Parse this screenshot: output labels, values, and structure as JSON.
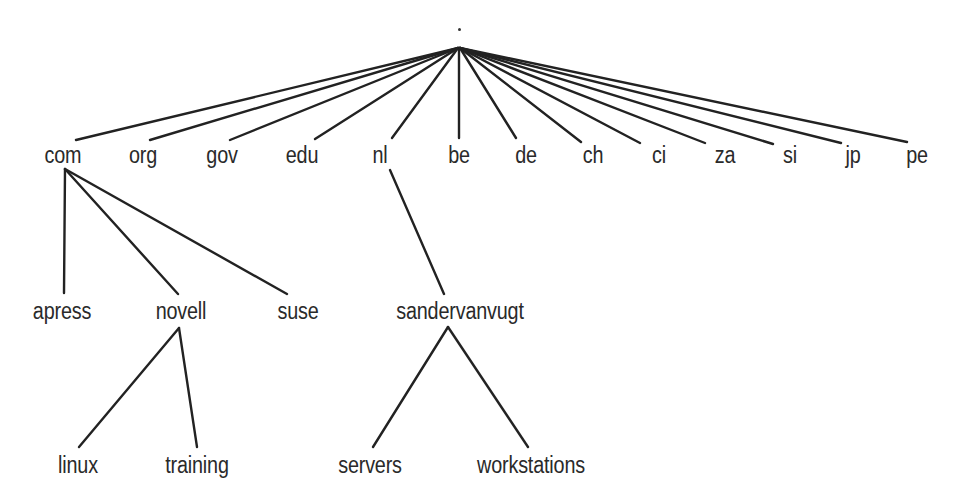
{
  "diagram": {
    "type": "tree",
    "colors": {
      "line": "#222222",
      "text": "#2a2a2a",
      "background": "#ffffff"
    },
    "root": {
      "id": "root",
      "label": ".",
      "x": 459,
      "y": 29,
      "apex_y": 48
    },
    "nodes": [
      {
        "id": "com",
        "label": "com",
        "x": 63,
        "y": 144,
        "parent": "root"
      },
      {
        "id": "org",
        "label": "org",
        "x": 143,
        "y": 144,
        "parent": "root"
      },
      {
        "id": "gov",
        "label": "gov",
        "x": 222,
        "y": 144,
        "parent": "root"
      },
      {
        "id": "edu",
        "label": "edu",
        "x": 302,
        "y": 144,
        "parent": "root"
      },
      {
        "id": "nl",
        "label": "nl",
        "x": 380,
        "y": 144,
        "parent": "root"
      },
      {
        "id": "be",
        "label": "be",
        "x": 459,
        "y": 144,
        "parent": "root"
      },
      {
        "id": "de",
        "label": "de",
        "x": 526,
        "y": 144,
        "parent": "root"
      },
      {
        "id": "ch",
        "label": "ch",
        "x": 593,
        "y": 144,
        "parent": "root"
      },
      {
        "id": "ci",
        "label": "ci",
        "x": 659,
        "y": 144,
        "parent": "root"
      },
      {
        "id": "za",
        "label": "za",
        "x": 725,
        "y": 144,
        "parent": "root"
      },
      {
        "id": "si",
        "label": "si",
        "x": 790,
        "y": 144,
        "parent": "root"
      },
      {
        "id": "jp",
        "label": "jp",
        "x": 853,
        "y": 144,
        "parent": "root"
      },
      {
        "id": "pe",
        "label": "pe",
        "x": 917,
        "y": 144,
        "parent": "root"
      },
      {
        "id": "apress",
        "label": "apress",
        "x": 62,
        "y": 300,
        "parent": "com"
      },
      {
        "id": "novell",
        "label": "novell",
        "x": 181,
        "y": 300,
        "parent": "com"
      },
      {
        "id": "suse",
        "label": "suse",
        "x": 298,
        "y": 300,
        "parent": "com"
      },
      {
        "id": "sandervanvugt",
        "label": "sandervanvugt",
        "x": 460,
        "y": 300,
        "parent": "nl"
      },
      {
        "id": "linux",
        "label": "linux",
        "x": 78,
        "y": 454,
        "parent": "novell"
      },
      {
        "id": "training",
        "label": "training",
        "x": 197,
        "y": 454,
        "parent": "novell"
      },
      {
        "id": "servers",
        "label": "servers",
        "x": 370,
        "y": 454,
        "parent": "sandervanvugt"
      },
      {
        "id": "workstations",
        "label": "workstations",
        "x": 531,
        "y": 454,
        "parent": "sandervanvugt"
      }
    ],
    "edges": [
      {
        "from": "root",
        "to": "com",
        "x1": 458,
        "y1": 48,
        "x2": 76,
        "y2": 140
      },
      {
        "from": "root",
        "to": "org",
        "x1": 458,
        "y1": 48,
        "x2": 150,
        "y2": 140
      },
      {
        "from": "root",
        "to": "gov",
        "x1": 458,
        "y1": 48,
        "x2": 230,
        "y2": 140
      },
      {
        "from": "root",
        "to": "edu",
        "x1": 458,
        "y1": 48,
        "x2": 315,
        "y2": 139
      },
      {
        "from": "root",
        "to": "nl",
        "x1": 458,
        "y1": 48,
        "x2": 392,
        "y2": 138
      },
      {
        "from": "root",
        "to": "be",
        "x1": 459,
        "y1": 48,
        "x2": 459,
        "y2": 138
      },
      {
        "from": "root",
        "to": "de",
        "x1": 460,
        "y1": 48,
        "x2": 516,
        "y2": 138
      },
      {
        "from": "root",
        "to": "ch",
        "x1": 460,
        "y1": 48,
        "x2": 581,
        "y2": 142
      },
      {
        "from": "root",
        "to": "ci",
        "x1": 460,
        "y1": 48,
        "x2": 640,
        "y2": 143
      },
      {
        "from": "root",
        "to": "za",
        "x1": 460,
        "y1": 48,
        "x2": 705,
        "y2": 143
      },
      {
        "from": "root",
        "to": "si",
        "x1": 460,
        "y1": 48,
        "x2": 773,
        "y2": 144
      },
      {
        "from": "root",
        "to": "jp",
        "x1": 460,
        "y1": 48,
        "x2": 841,
        "y2": 143
      },
      {
        "from": "root",
        "to": "pe",
        "x1": 460,
        "y1": 48,
        "x2": 907,
        "y2": 142
      },
      {
        "from": "com",
        "to": "apress",
        "x1": 65,
        "y1": 169,
        "x2": 64,
        "y2": 293
      },
      {
        "from": "com",
        "to": "novell",
        "x1": 65,
        "y1": 169,
        "x2": 178,
        "y2": 294
      },
      {
        "from": "com",
        "to": "suse",
        "x1": 65,
        "y1": 169,
        "x2": 287,
        "y2": 294
      },
      {
        "from": "nl",
        "to": "sandervanvugt",
        "x1": 390,
        "y1": 170,
        "x2": 444,
        "y2": 294
      },
      {
        "from": "novell",
        "to": "linux",
        "x1": 179,
        "y1": 328,
        "x2": 79,
        "y2": 447
      },
      {
        "from": "novell",
        "to": "training",
        "x1": 179,
        "y1": 328,
        "x2": 197,
        "y2": 447
      },
      {
        "from": "sandervanvugt",
        "to": "servers",
        "x1": 448,
        "y1": 327,
        "x2": 373,
        "y2": 447
      },
      {
        "from": "sandervanvugt",
        "to": "workstations",
        "x1": 448,
        "y1": 327,
        "x2": 528,
        "y2": 447
      }
    ]
  }
}
